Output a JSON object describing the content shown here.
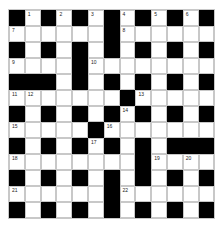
{
  "puzzle": {
    "rows": 13,
    "cols": 13,
    "colors": {
      "block": "#000000",
      "open": "#ffffff",
      "gridline": "#c8c8c8"
    },
    "grid": [
      [
        "#",
        "1",
        "#",
        "2",
        "#",
        "3",
        "#",
        "4",
        "#",
        "5",
        "#",
        "6",
        "#"
      ],
      [
        "7",
        ".",
        ".",
        ".",
        ".",
        ".",
        "#",
        "8",
        ".",
        ".",
        ".",
        ".",
        "."
      ],
      [
        "#",
        ".",
        "#",
        ".",
        "#",
        ".",
        "#",
        ".",
        "#",
        ".",
        "#",
        ".",
        "#"
      ],
      [
        "9",
        ".",
        ".",
        ".",
        "#",
        "10",
        ".",
        ".",
        ".",
        ".",
        ".",
        ".",
        "."
      ],
      [
        "#",
        "#",
        "#",
        ".",
        "#",
        ".",
        "#",
        ".",
        "#",
        ".",
        "#",
        ".",
        "#"
      ],
      [
        "11",
        "12",
        ".",
        ".",
        ".",
        ".",
        ".",
        "#",
        "13",
        ".",
        ".",
        ".",
        "."
      ],
      [
        "#",
        ".",
        "#",
        ".",
        "#",
        ".",
        "#",
        "14",
        "#",
        ".",
        "#",
        ".",
        "#"
      ],
      [
        "15",
        ".",
        ".",
        ".",
        ".",
        "#",
        "16",
        ".",
        ".",
        ".",
        ".",
        ".",
        "."
      ],
      [
        "#",
        ".",
        "#",
        ".",
        "#",
        "17",
        "#",
        ".",
        "#",
        ".",
        "#",
        "#",
        "#"
      ],
      [
        "18",
        ".",
        ".",
        ".",
        ".",
        ".",
        ".",
        ".",
        "#",
        "19",
        ".",
        "20",
        "."
      ],
      [
        "#",
        ".",
        "#",
        ".",
        "#",
        ".",
        "#",
        ".",
        "#",
        ".",
        "#",
        ".",
        "#"
      ],
      [
        "21",
        ".",
        ".",
        ".",
        ".",
        ".",
        "#",
        "22",
        ".",
        ".",
        ".",
        ".",
        "."
      ],
      [
        "#",
        ".",
        "#",
        ".",
        "#",
        ".",
        "#",
        ".",
        "#",
        ".",
        "#",
        ".",
        "#"
      ]
    ]
  }
}
